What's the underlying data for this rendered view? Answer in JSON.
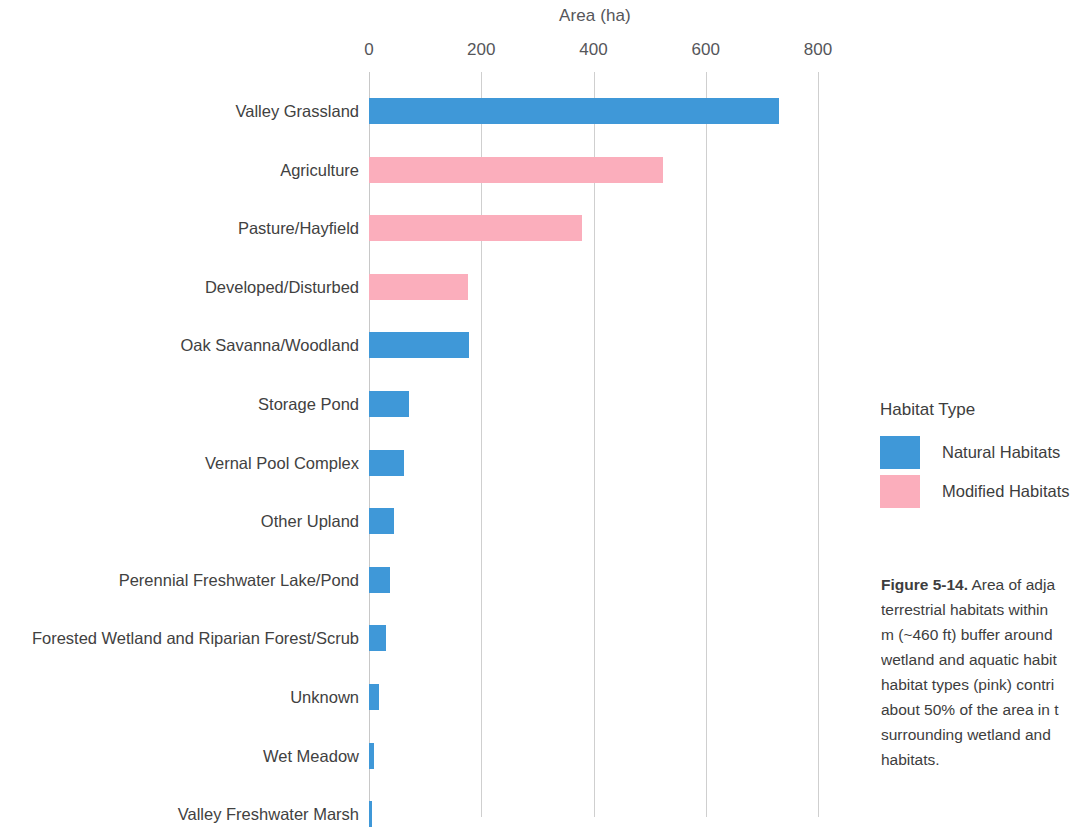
{
  "chart_data": {
    "type": "bar",
    "orientation": "horizontal",
    "title": "",
    "xlabel": "Area (ha)",
    "ylabel": "",
    "xlim": [
      0,
      800
    ],
    "xticks": [
      0,
      200,
      400,
      600,
      800
    ],
    "xticklabels": [
      "0",
      "200",
      "400",
      "600",
      "800"
    ],
    "grid": "vertical",
    "categories": [
      "Valley Grassland",
      "Agriculture",
      "Pasture/Hayfield",
      "Developed/Disturbed",
      "Oak Savanna/Woodland",
      "Storage Pond",
      "Vernal Pool Complex",
      "Other Upland",
      "Perennial Freshwater Lake/Pond",
      "Forested Wetland and Riparian Forest/Scrub",
      "Unknown",
      "Wet Meadow",
      "Valley Freshwater Marsh"
    ],
    "values": [
      731,
      524,
      379,
      177,
      179,
      71,
      62,
      44,
      37,
      30,
      18,
      9,
      3
    ],
    "groups": [
      "Natural Habitats",
      "Modified Habitats",
      "Modified Habitats",
      "Modified Habitats",
      "Natural Habitats",
      "Natural Habitats",
      "Natural Habitats",
      "Natural Habitats",
      "Natural Habitats",
      "Natural Habitats",
      "Natural Habitats",
      "Natural Habitats",
      "Natural Habitats"
    ],
    "colors": {
      "Natural Habitats": "#3f98d8",
      "Modified Habitats": "#fbaebc"
    },
    "legend": {
      "title": "Habitat Type",
      "position": "right",
      "entries": [
        {
          "label": "Natural Habitats",
          "color": "#3f98d8"
        },
        {
          "label": "Modified Habitats",
          "color": "#fbaebc"
        }
      ]
    }
  },
  "axis": {
    "title": "Area (ha)",
    "ticks": [
      "0",
      "200",
      "400",
      "600",
      "800"
    ]
  },
  "legend": {
    "title": "Habitat Type",
    "natural_label": "Natural Habitats",
    "modified_label": "Modified Habitats"
  },
  "caption": {
    "figure_number": "Figure 5-14.",
    "lines": [
      " Area of adja",
      "terrestrial habitats within",
      "m (~460 ft) buffer around",
      "wetland and aquatic habit",
      "habitat types (pink) contri",
      "about 50% of the area in t",
      "surrounding wetland and",
      "habitats."
    ]
  }
}
